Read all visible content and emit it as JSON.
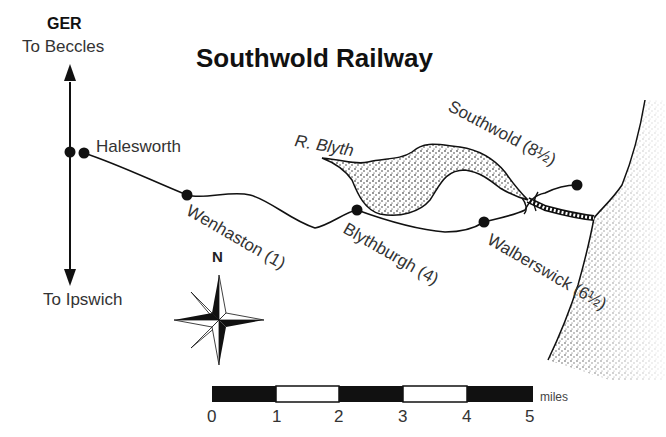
{
  "map": {
    "title": "Southwold Railway",
    "connection": {
      "company": "GER",
      "north": "To Beccles",
      "south": "To Ipswich"
    },
    "river": "R. Blyth",
    "stations": [
      {
        "name": "Halesworth",
        "label": "Halesworth"
      },
      {
        "name": "Wenhaston",
        "label": "Wenhaston (1)"
      },
      {
        "name": "Blythburgh",
        "label": "Blythburgh (4)"
      },
      {
        "name": "Walberswick",
        "label": "Walberswick (6½)"
      },
      {
        "name": "Southwold",
        "label": "Southwold (8½)"
      }
    ],
    "compass": {
      "north_label": "N"
    },
    "scale": {
      "ticks": [
        "0",
        "1",
        "2",
        "3",
        "4",
        "5"
      ],
      "unit": "miles"
    }
  },
  "colors": {
    "ink": "#111111",
    "paper": "#ffffff",
    "label": "#333333"
  }
}
